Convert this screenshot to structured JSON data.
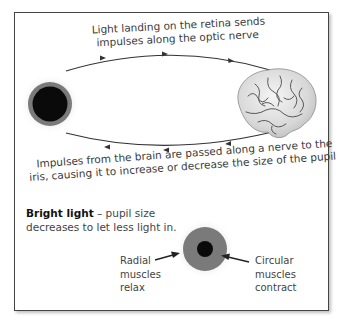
{
  "diagram": {
    "top_text": {
      "line1": "Light landing on the retina sends",
      "line2": "impulses along the optic nerve"
    },
    "bottom_text": {
      "line1": "Impulses from the brain are passed along a nerve to the",
      "line2": "iris, causing it to increase or decrease the size of the pupil"
    },
    "nodes": [
      {
        "id": "eye",
        "icon": "eye-icon"
      },
      {
        "id": "brain",
        "icon": "brain-icon"
      }
    ],
    "caption": {
      "bold": "Bright light",
      "rest": " – pupil size",
      "line2": "decreases to let less light in."
    },
    "labels": {
      "left": [
        "Radial",
        "muscles",
        "relax"
      ],
      "right": [
        "Circular",
        "muscles",
        "contract"
      ]
    },
    "colors": {
      "pupil": "#0a0a0a",
      "iris": "#7a7a7a",
      "frame": "#444444",
      "arrow": "#333333"
    }
  }
}
